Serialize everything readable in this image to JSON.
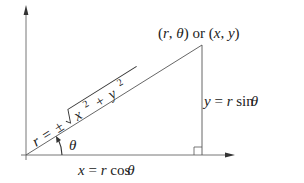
{
  "diagram": {
    "point_label": {
      "polar": "(r, θ)",
      "connector": "or",
      "cartesian": "(x, y)"
    },
    "hypotenuse_label": {
      "lhs": "r",
      "eq": "=",
      "pm": "±",
      "radicand": "x² + y²",
      "x": "x",
      "x_exp": "2",
      "plus": "+",
      "y": "y",
      "y_exp": "2"
    },
    "angle_label": "θ",
    "vertical_label": {
      "lhs": "y",
      "eq": "=",
      "r": "r",
      "fn": "sin",
      "theta": "θ"
    },
    "horizontal_label": {
      "lhs": "x",
      "eq": "=",
      "r": "r",
      "fn": "cos",
      "theta": "θ"
    },
    "colors": {
      "stroke": "#555555",
      "text": "#222222",
      "background": "#ffffff"
    },
    "geometry": {
      "origin": [
        26,
        155
      ],
      "apex": [
        202,
        45
      ],
      "foot": [
        202,
        155
      ],
      "x_axis_end": [
        234,
        155
      ],
      "y_axis_end": [
        26,
        6
      ]
    }
  }
}
